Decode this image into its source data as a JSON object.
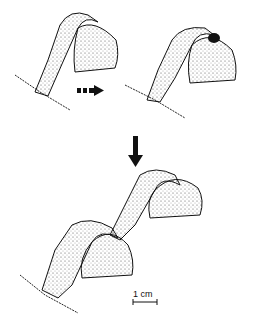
{
  "figure": {
    "panels": [
      {
        "id": "stage-1",
        "description": "tube arching onto hemispherical body"
      },
      {
        "id": "stage-2",
        "description": "tube with dark opening on hemispherical body"
      },
      {
        "id": "stage-3",
        "description": "tube extended with second hemispherical body"
      }
    ],
    "arrows": [
      {
        "id": "dashed-arrow",
        "direction": "right"
      },
      {
        "id": "down-arrow",
        "direction": "down"
      }
    ],
    "scale_bar": {
      "label": "1 cm"
    },
    "ink_color": "#1a1a1a",
    "background": "#ffffff"
  }
}
